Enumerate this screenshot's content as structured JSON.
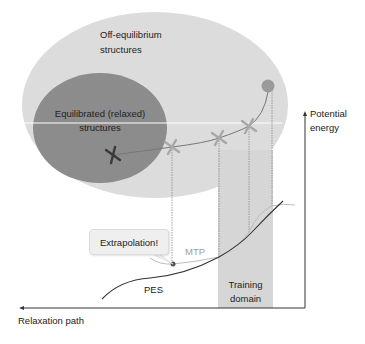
{
  "diagram": {
    "regions": {
      "off_equilibrium": "Off-equilibrium structures",
      "off_equilibrium_line1": "Off-equilibrium",
      "off_equilibrium_line2": "structures",
      "equilibrated_line1": "Equilibrated (relaxed)",
      "equilibrated_line2": "structures"
    },
    "axes": {
      "y_label_line1": "Potential",
      "y_label_line2": "energy",
      "x_label": "Relaxation path"
    },
    "curves": {
      "pes_label": "PES",
      "mtp_label": "MTP"
    },
    "training_domain_line1": "Training",
    "training_domain_line2": "domain",
    "callout": "Extrapolation!",
    "markers": [
      {
        "type": "cross",
        "shade": "dark"
      },
      {
        "type": "cross",
        "shade": "light"
      },
      {
        "type": "cross",
        "shade": "light"
      },
      {
        "type": "cross",
        "shade": "light"
      },
      {
        "type": "circle",
        "shade": "medium"
      }
    ],
    "colors": {
      "outer_region": "#dcdcdc",
      "inner_region": "#8c8c8c",
      "training_band": "#d6d6d6",
      "pes_line": "#333333",
      "mtp_line": "#bdbdbd",
      "cross_dark": "#3a3a3a",
      "cross_light": "#a8a8a8",
      "circle": "#9a9a9a"
    }
  }
}
